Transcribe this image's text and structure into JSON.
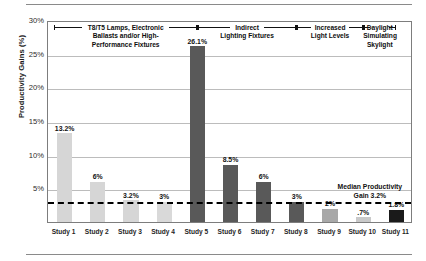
{
  "chart_data": {
    "type": "bar",
    "title": "",
    "xlabel": "",
    "ylabel": "Productivity Gains (%)",
    "ylim": [
      0,
      30
    ],
    "grid": true,
    "legend_position": "none",
    "categories": [
      "Study 1",
      "Study 2",
      "Study 3",
      "Study 4",
      "Study 5",
      "Study 6",
      "Study 7",
      "Study 8",
      "Study 9",
      "Study 10",
      "Study 11"
    ],
    "values": [
      13.2,
      6,
      3.2,
      3,
      26.1,
      8.5,
      6,
      3,
      2,
      0.7,
      1.8
    ],
    "data_labels": [
      "13.2%",
      "6%",
      "3.2%",
      "3%",
      "26.1%",
      "8.5%",
      "6%",
      "3%",
      "2%",
      ".7%",
      "1.8%"
    ],
    "bar_colors": [
      "#d6d6d6",
      "#d6d6d6",
      "#d6d6d6",
      "#d9d9d9",
      "#595959",
      "#595959",
      "#595959",
      "#595959",
      "#a8a8a8",
      "#c9c9c9",
      "#1a1a1a"
    ],
    "y_ticks": [
      {
        "value": 30,
        "label": "30%"
      },
      {
        "value": 25,
        "label": "25%"
      },
      {
        "value": 20,
        "label": "20%"
      },
      {
        "value": 15,
        "label": "15%"
      },
      {
        "value": 10,
        "label": "10%"
      },
      {
        "value": 5,
        "label": "5%"
      }
    ],
    "reference_line": {
      "value": 3.2,
      "label_line1": "Median Productivity",
      "label_line2": "Gain 3.2%",
      "style": "dashed"
    },
    "group_annotations": [
      {
        "text_line1": "T8/T5 Lamps, Electronic",
        "text_line2": "Ballasts and/or High-",
        "text_line3": "Performance Fixtures",
        "start_category": "Study 1",
        "end_category": "Study 5"
      },
      {
        "text_line1": "Indirect",
        "text_line2": "Lighting Fixtures",
        "text_line3": "",
        "start_category": "Study 5",
        "end_category": "Study 8"
      },
      {
        "text_line1": "Increased",
        "text_line2": "Light Levels",
        "text_line3": "",
        "start_category": "Study 8",
        "end_category": "Study 10"
      },
      {
        "text_line1": "Daylight",
        "text_line2": "Simulating",
        "text_line3": "Skylight",
        "start_category": "Study 10",
        "end_category": "Study 11"
      }
    ]
  }
}
